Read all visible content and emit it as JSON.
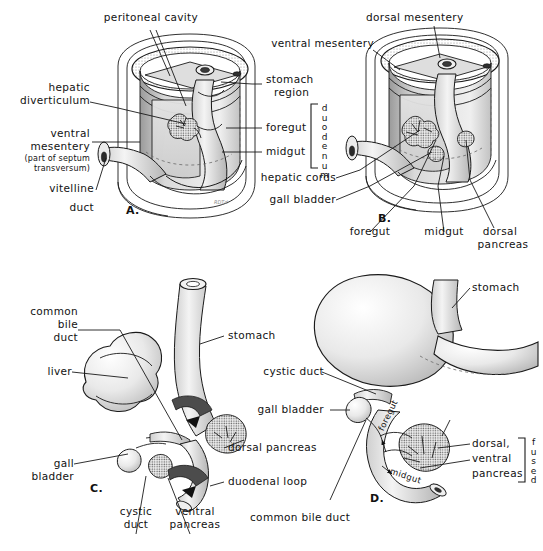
{
  "figure": {
    "panels": [
      "A.",
      "B.",
      "C.",
      "D."
    ],
    "ink": "#1a1a1a",
    "paper": "#ffffff"
  },
  "panel_a": {
    "id": "A.",
    "labels": {
      "peritoneal_cavity": "peritoneal cavity",
      "hepatic": "hepatic",
      "diverticulum": "diverticulum",
      "ventral": "ventral",
      "mesentery": "mesentery",
      "septum_note_1": "(part of septum",
      "septum_note_2": "transversum)",
      "vitelline": "vitelline",
      "duct": "duct",
      "stomach": "stomach",
      "region": "region",
      "foregut": "foregut",
      "midgut": "midgut",
      "duodenum": "duodenum"
    }
  },
  "panel_b": {
    "id": "B.",
    "labels": {
      "dorsal_mesentery": "dorsal  mesentery",
      "ventral_mesentery": "ventral mesentery",
      "hepatic_cords": "hepatic cords",
      "gall_bladder": "gall bladder",
      "foregut": "foregut",
      "midgut": "midgut",
      "dorsal": "dorsal",
      "pancreas": "pancreas"
    }
  },
  "panel_c": {
    "id": "C.",
    "labels": {
      "common": "common",
      "bile": "bile",
      "duct": "duct",
      "liver": "liver",
      "gall": "gall",
      "bladder": "bladder",
      "cystic": "cystic",
      "cystic_duct": "duct",
      "ventral": "ventral",
      "pancreas": "pancreas",
      "stomach": "stomach",
      "dorsal_pancreas": "dorsal pancreas",
      "duodenal_loop": "duodenal loop"
    }
  },
  "panel_d": {
    "id": "D.",
    "labels": {
      "cystic_duct": "cystic duct",
      "gall_bladder": "gall bladder",
      "stomach": "stomach",
      "common_bile_duct": "common bile duct",
      "dorsal": "dorsal,",
      "ventral": "ventral",
      "pancreas": "pancreas",
      "fused": "fused",
      "foregut_arrow": "foregut",
      "midgut_arrow": "midgut"
    }
  }
}
